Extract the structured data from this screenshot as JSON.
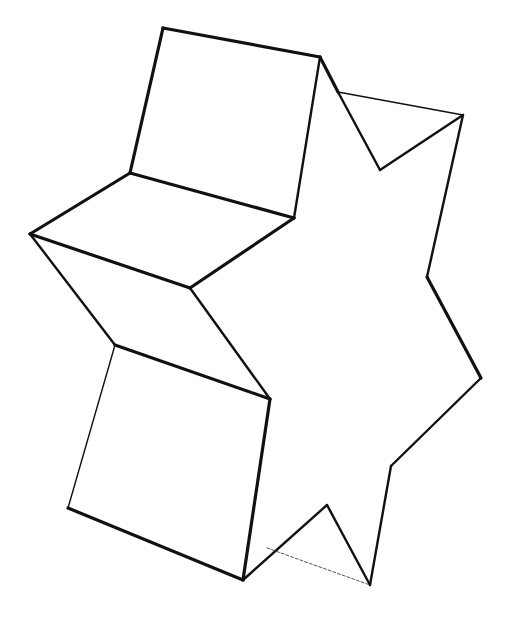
{
  "drawing": {
    "title": "",
    "description": "Hand-drawn 3D star-shaped prism sketch",
    "stroke_color": "#111111",
    "background_color": "#ffffff",
    "edges": [
      {
        "name": "top-face-top-edge",
        "from": [
          163,
          28
        ],
        "to": [
          320,
          57
        ],
        "weight": "thick"
      },
      {
        "name": "top-face-left-edge",
        "from": [
          163,
          28
        ],
        "to": [
          130,
          173
        ],
        "weight": "thick"
      },
      {
        "name": "top-face-right-edge",
        "from": [
          320,
          57
        ],
        "to": [
          294,
          218
        ],
        "weight": "med"
      },
      {
        "name": "top-face-bottom-edge",
        "from": [
          130,
          173
        ],
        "to": [
          294,
          218
        ],
        "weight": "thick"
      },
      {
        "name": "upper-left-face-top",
        "from": [
          130,
          173
        ],
        "to": [
          30,
          234
        ],
        "weight": "thick"
      },
      {
        "name": "upper-left-face-bottom",
        "from": [
          30,
          234
        ],
        "to": [
          190,
          288
        ],
        "weight": "thick"
      },
      {
        "name": "upper-left-face-right",
        "from": [
          190,
          288
        ],
        "to": [
          294,
          218
        ],
        "weight": "thick"
      },
      {
        "name": "left-point-lower",
        "from": [
          30,
          234
        ],
        "to": [
          115,
          345
        ],
        "weight": "med"
      },
      {
        "name": "mid-diagonal",
        "from": [
          190,
          288
        ],
        "to": [
          270,
          399
        ],
        "weight": "med"
      },
      {
        "name": "lower-face-top",
        "from": [
          115,
          345
        ],
        "to": [
          270,
          399
        ],
        "weight": "thick"
      },
      {
        "name": "lower-face-left",
        "from": [
          115,
          345
        ],
        "to": [
          68,
          508
        ],
        "weight": "thin"
      },
      {
        "name": "lower-face-right",
        "from": [
          270,
          399
        ],
        "to": [
          243,
          580
        ],
        "weight": "thick"
      },
      {
        "name": "lower-face-bottom",
        "from": [
          68,
          508
        ],
        "to": [
          243,
          580
        ],
        "weight": "thick"
      },
      {
        "name": "top-right-slant",
        "from": [
          320,
          57
        ],
        "to": [
          338,
          92
        ],
        "weight": "thick"
      },
      {
        "name": "top-notch-left",
        "from": [
          338,
          92
        ],
        "to": [
          380,
          170
        ],
        "weight": "med"
      },
      {
        "name": "top-notch-back",
        "from": [
          338,
          92
        ],
        "to": [
          463,
          115
        ],
        "weight": "thin"
      },
      {
        "name": "top-notch-right",
        "from": [
          380,
          170
        ],
        "to": [
          463,
          115
        ],
        "weight": "med"
      },
      {
        "name": "right-upper-side",
        "from": [
          463,
          115
        ],
        "to": [
          427,
          277
        ],
        "weight": "med"
      },
      {
        "name": "right-point-upper",
        "from": [
          427,
          277
        ],
        "to": [
          481,
          378
        ],
        "weight": "thick"
      },
      {
        "name": "right-point-lower",
        "from": [
          481,
          378
        ],
        "to": [
          391,
          466
        ],
        "weight": "med"
      },
      {
        "name": "right-lower-side",
        "from": [
          391,
          466
        ],
        "to": [
          370,
          585
        ],
        "weight": "med"
      },
      {
        "name": "bottom-notch-right",
        "from": [
          370,
          585
        ],
        "to": [
          327,
          505
        ],
        "weight": "med"
      },
      {
        "name": "bottom-notch-left",
        "from": [
          327,
          505
        ],
        "to": [
          243,
          580
        ],
        "weight": "med"
      },
      {
        "name": "bottom-hidden-edge",
        "from": [
          267,
          548
        ],
        "to": [
          370,
          585
        ],
        "weight": "faint"
      }
    ]
  }
}
